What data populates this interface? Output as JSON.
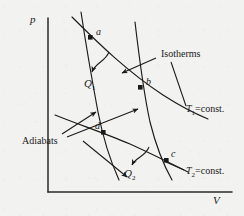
{
  "figure": {
    "kind": "carnot-cycle-pv-diagram",
    "background_color": "#f2f2f0",
    "ink_color": "#1a1a1a"
  },
  "axes": {
    "y_label": "p",
    "x_label": "V",
    "origin": [
      48,
      192
    ],
    "y_top": [
      48,
      18
    ],
    "x_right": [
      232,
      192
    ]
  },
  "points": [
    {
      "id": "a",
      "label": "a",
      "x": 91,
      "y": 38,
      "label_x": 96,
      "label_y": 30
    },
    {
      "id": "b",
      "label": "b",
      "x": 141,
      "y": 88,
      "label_x": 146,
      "label_y": 80
    },
    {
      "id": "c",
      "label": "c",
      "x": 167,
      "y": 161,
      "label_x": 171,
      "label_y": 152
    },
    {
      "id": "d",
      "label": "d",
      "x": 104,
      "y": 133,
      "label_x": 96,
      "label_y": 125
    }
  ],
  "annotations": {
    "isotherms": {
      "text": "Isotherms",
      "x": 161,
      "y": 54
    },
    "adiabats": {
      "text": "Adiabats",
      "x": 32,
      "y": 141
    },
    "q1": {
      "text": "Q",
      "sub": "1",
      "x": 91,
      "y": 84
    },
    "q2": {
      "text": "Q",
      "sub": "2",
      "x": 131,
      "y": 174
    },
    "t1": {
      "symbol": "T",
      "sub": "1",
      "rest": "=const.",
      "x": 186,
      "y": 110
    },
    "t2": {
      "symbol": "T",
      "sub": "2",
      "rest": "=const.",
      "x": 186,
      "y": 172
    }
  },
  "curves": {
    "isotherm_t1": {
      "name": "T1 isotherm",
      "path": "M 72,17 C 100,45 128,72 163,95 C 180,106 196,114 208,119"
    },
    "isotherm_t2": {
      "name": "T2 isotherm",
      "path": "M 55,115 C 80,125 104,133 130,144 C 150,153 170,163 188,172"
    },
    "adiabat_left": {
      "name": "adiabat a-d",
      "path": "M 81,12 C 86,45 92,80 98,112 C 103,138 110,160 119,180"
    },
    "adiabat_right": {
      "name": "adiabat b-c",
      "path": "M 135,22 C 139,56 143,90 150,122 C 156,146 163,164 172,180"
    }
  },
  "arrows": {
    "q1": {
      "name": "q1-flow-arrow",
      "path": "M 108,53 C 104,62 96,63 92,71",
      "tip": [
        91,
        76
      ]
    },
    "q2": {
      "name": "q2-flow-arrow",
      "path": "M 148,148 C 144,157 136,158 132,164",
      "tip": [
        130,
        169
      ]
    },
    "isotherm_leader_1": {
      "name": "isotherms-leader-to-t1",
      "path": "M 155,58 L 124,72",
      "tip": [
        120,
        74
      ]
    },
    "isotherm_leader_2": {
      "name": "isotherms-leader-to-t2",
      "path": "M 170,62 L 186,108"
    },
    "adiabat_leader_1": {
      "name": "adiabats-leader-left",
      "path": "M 62,135 L 96,114",
      "tip": [
        96,
        110
      ]
    },
    "adiabat_leader_2": {
      "name": "adiabats-leader-right",
      "path": "M 66,138 L 138,110",
      "tip": [
        141,
        108
      ]
    },
    "adiabat_leader_3": {
      "name": "adiabats-leader-down",
      "path": "M 82,142 L 126,176",
      "tip": [
        129,
        179
      ]
    }
  }
}
